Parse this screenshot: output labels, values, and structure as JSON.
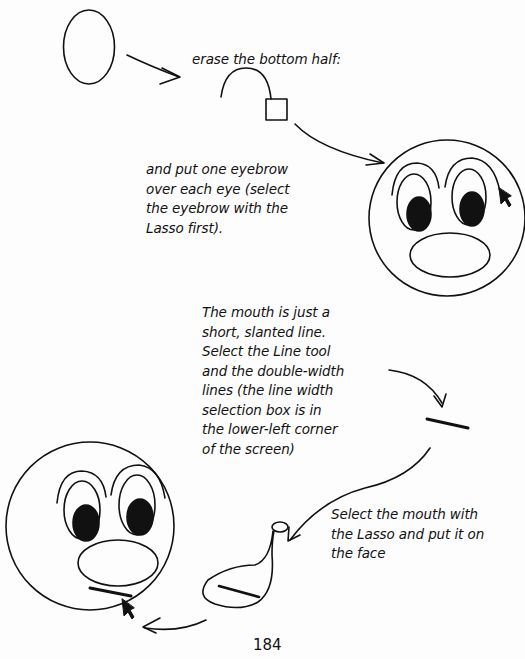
{
  "page": {
    "number": "184",
    "captions": {
      "erase": "erase the bottom half:",
      "eyebrow": "and put one eyebrow\nover each eye (select\nthe eyebrow with the\nLasso first).",
      "mouth": "The mouth is just a\nshort, slanted line.\nSelect the Line tool\nand the double-width\nlines (the line width\nselection box is in\nthe lower-left corner\nof the screen)",
      "lasso": "Select the mouth with\nthe Lasso and put it on\nthe face"
    },
    "illustrations": [
      {
        "name": "oval",
        "description": "starting oval"
      },
      {
        "name": "half-oval-eyebrow",
        "description": "oval with bottom half erased"
      },
      {
        "name": "eraser-square",
        "description": "eraser tool square"
      },
      {
        "name": "face-with-eyebrows",
        "description": "face with eyes, nose and eyebrows, pointer arrow"
      },
      {
        "name": "mouth-line",
        "description": "short slanted double-width line"
      },
      {
        "name": "lasso-selection",
        "description": "lasso loop around mouth line"
      },
      {
        "name": "finished-face",
        "description": "face with mouth placed, pointer arrow"
      }
    ],
    "colors": {
      "ink": "#111111",
      "paper": "#fdfdfd"
    }
  }
}
